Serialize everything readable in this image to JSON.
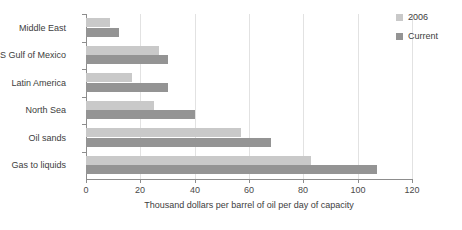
{
  "chart_data": {
    "type": "bar",
    "orientation": "horizontal",
    "title": "",
    "xlabel": "Thousand dollars per barrel of oil per day of capacity",
    "ylabel": "",
    "xlim": [
      0,
      120
    ],
    "xticks": [
      0,
      20,
      40,
      60,
      80,
      100,
      120
    ],
    "grid": true,
    "legend_position": "right",
    "categories": [
      "Middle East",
      "US Gulf of Mexico",
      "Latin America",
      "North Sea",
      "Oil sands",
      "Gas to liquids"
    ],
    "series": [
      {
        "name": "2006",
        "color": "#c9c9c9",
        "values": [
          9,
          27,
          17,
          25,
          57,
          83
        ]
      },
      {
        "name": "Current",
        "color": "#949494",
        "values": [
          12,
          30,
          30,
          40,
          68,
          107
        ]
      }
    ]
  },
  "legend": {
    "items": [
      {
        "label": "2006",
        "color": "#c9c9c9"
      },
      {
        "label": "Current",
        "color": "#949494"
      }
    ]
  },
  "axis": {
    "x_title": "Thousand dollars per barrel of oil per day of capacity",
    "x_tick_labels": [
      "0",
      "20",
      "40",
      "60",
      "80",
      "100",
      "120"
    ]
  },
  "categories": [
    "Middle East",
    "US Gulf of Mexico",
    "Latin America",
    "North Sea",
    "Oil sands",
    "Gas to liquids"
  ]
}
